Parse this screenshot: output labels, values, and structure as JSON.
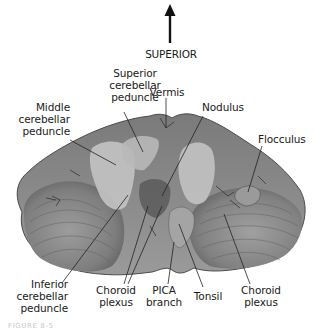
{
  "figure": {
    "orientation": {
      "label": "SUPERIOR",
      "arrow": "up-arrow"
    },
    "specimen": "cerebellum-anterior-view",
    "labels": {
      "superior_cerebellar_peduncle": "Superior\ncerebellar\npeduncle",
      "vermis": "Vermis",
      "nodulus": "Nodulus",
      "middle_cerebellar_peduncle": "Middle\ncerebellar\npeduncle",
      "flocculus": "Flocculus",
      "inferior_cerebellar_peduncle": "Inferior\ncerebellar\npeduncle",
      "choroid_plexus_left": "Choroid\nplexus",
      "pica_branch": "PICA\nbranch",
      "tonsil": "Tonsil",
      "choroid_plexus_right": "Choroid\nplexus"
    },
    "caption": "FIGURE 8-5"
  },
  "colors": {
    "background": "#ffffff",
    "text": "#1a1a1a",
    "specimen_light": "#a9a9a9",
    "specimen_mid": "#8a8a8a",
    "specimen_dark": "#5a5a5a",
    "peduncle_light": "#c4c4c4",
    "leader_line": "#222222"
  }
}
